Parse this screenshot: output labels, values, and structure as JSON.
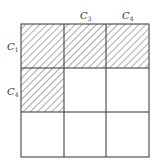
{
  "diagram": {
    "type": "grid",
    "rows": 3,
    "cols": 3,
    "hatched_cells": [
      [
        0,
        0
      ],
      [
        0,
        1
      ],
      [
        0,
        2
      ],
      [
        1,
        0
      ]
    ],
    "column_labels": [
      {
        "col": 1,
        "base": "C",
        "sub": "3"
      },
      {
        "col": 2,
        "base": "C",
        "sub": "4"
      }
    ],
    "row_labels": [
      {
        "row": 0,
        "base": "C",
        "sub": "1"
      },
      {
        "row": 1,
        "base": "C",
        "sub": "4"
      }
    ],
    "colors": {
      "line": "#333333",
      "hatch": "#444444",
      "background": "#ffffff"
    }
  }
}
